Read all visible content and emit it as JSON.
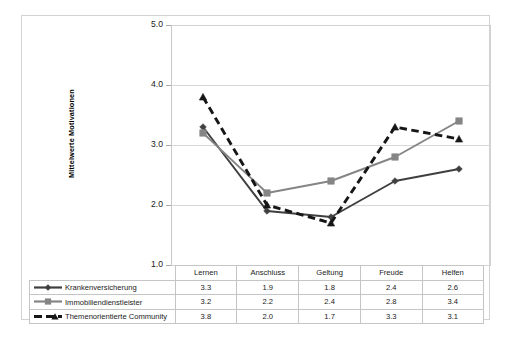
{
  "chart_data": {
    "type": "line",
    "title": "",
    "xlabel": "",
    "ylabel": "Mittelwerte Motivationen",
    "ylim": [
      1.0,
      5.0
    ],
    "ytick_labels": [
      "5.0",
      "4.0",
      "3.0",
      "2.0",
      "1.0"
    ],
    "yticks": [
      5.0,
      4.0,
      3.0,
      2.0,
      1.0
    ],
    "grid": true,
    "legend_position": "table-left",
    "categories": [
      "Lernen",
      "Anschluss",
      "Geltung",
      "Freude",
      "Helfen"
    ],
    "series": [
      {
        "name": "Krankenversicherung",
        "values": [
          3.3,
          1.9,
          1.8,
          2.4,
          2.6
        ],
        "labels": [
          "3.3",
          "1.9",
          "1.8",
          "2.4",
          "2.6"
        ],
        "color": "#3f3f3f",
        "marker": "diamond",
        "dash": "solid"
      },
      {
        "name": "Immobiliendienstleister",
        "values": [
          3.2,
          2.2,
          2.4,
          2.8,
          3.4
        ],
        "labels": [
          "3.2",
          "2.2",
          "2.4",
          "2.8",
          "3.4"
        ],
        "color": "#858585",
        "marker": "square",
        "dash": "solid"
      },
      {
        "name": "Themenorientierte Community",
        "values": [
          3.8,
          2.0,
          1.7,
          3.3,
          3.1
        ],
        "labels": [
          "3.8",
          "2.0",
          "1.7",
          "3.3",
          "3.1"
        ],
        "color": "#161616",
        "marker": "triangle",
        "dash": "dashed"
      }
    ]
  },
  "axis": {
    "y_title": "Mittelwerte Motivationen",
    "tick_5": "5.0",
    "tick_4": "4.0",
    "tick_3": "3.0",
    "tick_2": "2.0",
    "tick_1": "1.0"
  },
  "table": {
    "headers": [
      "Lernen",
      "Anschluss",
      "Geltung",
      "Freude",
      "Helfen"
    ],
    "rows": [
      {
        "label": "Krankenversicherung",
        "cells": [
          "3.3",
          "1.9",
          "1.8",
          "2.4",
          "2.6"
        ]
      },
      {
        "label": "Immobiliendienstleister",
        "cells": [
          "3.2",
          "2.2",
          "2.4",
          "2.8",
          "3.4"
        ]
      },
      {
        "label": "Themenorientierte Community",
        "cells": [
          "3.8",
          "2.0",
          "1.7",
          "3.3",
          "3.1"
        ]
      }
    ]
  }
}
